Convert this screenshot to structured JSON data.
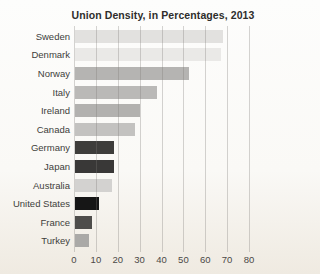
{
  "title": "Union Density, in Percentages, 2013",
  "chart_data": {
    "type": "bar",
    "orientation": "horizontal",
    "title": "Union Density, in Percentages, 2013",
    "categories": [
      "Sweden",
      "Denmark",
      "Norway",
      "Italy",
      "Ireland",
      "Canada",
      "Germany",
      "Japan",
      "Australia",
      "United States",
      "France",
      "Turkey"
    ],
    "values": [
      67.7,
      66.8,
      52.1,
      37.3,
      29.6,
      27.2,
      18.0,
      17.8,
      17.0,
      10.8,
      7.7,
      6.3
    ],
    "bar_colors": [
      "#e2e1df",
      "#eae9e7",
      "#b5b4b2",
      "#bab9b7",
      "#b2b1af",
      "#c3c2c0",
      "#3e3d3b",
      "#393837",
      "#d3d2d0",
      "#161616",
      "#4e4d4b",
      "#aaa9a7"
    ],
    "xlabel": "",
    "ylabel": "",
    "xlim": [
      0,
      80
    ],
    "x_ticks": [
      0,
      10,
      20,
      30,
      40,
      50,
      60,
      70,
      80
    ],
    "grid": "vertical",
    "legend": "none"
  },
  "colors": {
    "background_top": "#fdfdfc",
    "background_bottom": "#efeae1",
    "gridline": "#cfccc8",
    "title_text": "#2e2d2b",
    "category_text": "#403e3b",
    "tick_text": "#4b4946"
  }
}
